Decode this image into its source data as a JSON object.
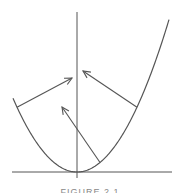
{
  "diagram": {
    "stroke_color": "#555555",
    "curve_color": "#555555",
    "curve": {
      "type": "parabola",
      "coefficient": 0.018,
      "x_range": [
        -64,
        92
      ]
    },
    "arrows": [
      {
        "name": "left-arrow",
        "from_x": -60,
        "to": [
          -5,
          94
        ]
      },
      {
        "name": "right-arrow",
        "from_x": 60,
        "to": [
          6,
          101
        ]
      },
      {
        "name": "bottom-arrow",
        "from_x": 23,
        "to": [
          -15,
          65
        ]
      }
    ]
  },
  "caption": {
    "text": "FIGURE 2.1"
  }
}
